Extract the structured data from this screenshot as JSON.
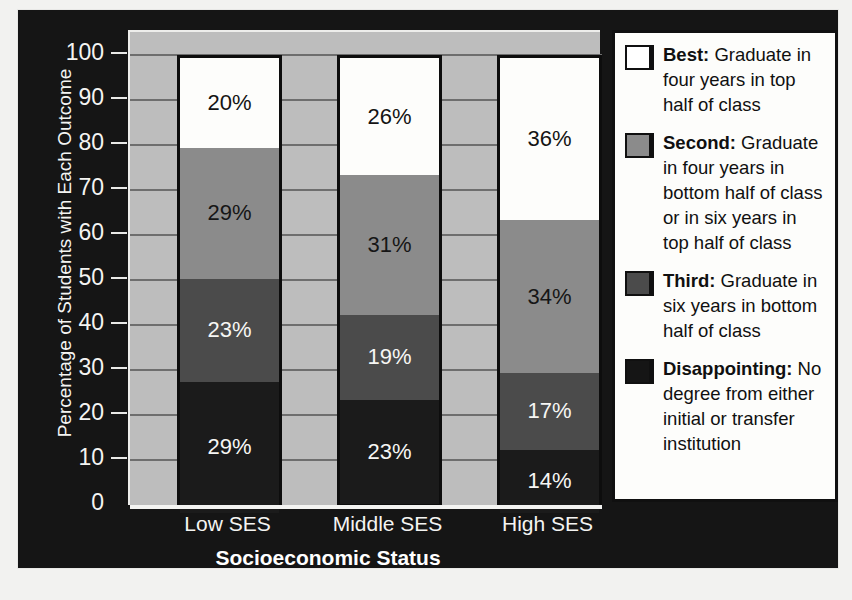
{
  "chart_data": {
    "type": "bar",
    "subtype": "stacked-bar-100",
    "title": "",
    "xlabel": "Socioeconomic Status",
    "ylabel": "Percentage of Students with Each Outcome",
    "categories": [
      "Low SES",
      "Middle SES",
      "High SES"
    ],
    "ylim": [
      0,
      100
    ],
    "yticks": [
      "100",
      "90",
      "80",
      "70",
      "60",
      "50",
      "40",
      "30",
      "20",
      "10",
      "0"
    ],
    "grid": true,
    "legend_position": "right",
    "series": [
      {
        "name": "Best",
        "key": "best",
        "legend_title": "Best:",
        "legend_desc": " Graduate in four years in top half of class",
        "color": "#ffffff",
        "values": [
          20,
          26,
          36
        ],
        "labels": [
          "20%",
          "26%",
          "36%"
        ]
      },
      {
        "name": "Second",
        "key": "second",
        "legend_title": "Second:",
        "legend_desc": " Graduate in four years in bottom half of class or in six years in top half of class",
        "color": "#8b8b8b",
        "values": [
          29,
          31,
          34
        ],
        "labels": [
          "29%",
          "31%",
          "34%"
        ]
      },
      {
        "name": "Third",
        "key": "third",
        "legend_title": "Third:",
        "legend_desc": " Graduate in six years in bottom half of class",
        "color": "#4b4b4b",
        "values": [
          23,
          19,
          17
        ],
        "labels": [
          "23%",
          "19%",
          "17%"
        ]
      },
      {
        "name": "Disappointing",
        "key": "disappointing",
        "legend_title": "Disappointing:",
        "legend_desc": " No degree from either initial or transfer institution",
        "color": "#151515",
        "values": [
          29,
          23,
          14
        ],
        "labels": [
          "29%",
          "23%",
          "14%"
        ]
      }
    ]
  },
  "axis": {
    "y_title": "Percentage of Students with Each Outcome",
    "x_title": "Socioeconomic Status"
  },
  "colors": {
    "frame": "#151515",
    "panel": "#bdbdbd",
    "gridline": "#6e6e6e",
    "bar_outline": "#0d0d0d",
    "axis_text": "#f4f4f2",
    "legend_bg": "#fdfdfb"
  }
}
